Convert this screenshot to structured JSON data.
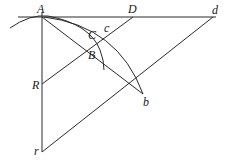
{
  "diagram": {
    "title": "",
    "points": {
      "A": {
        "label": "A",
        "x": 42,
        "y": 17
      },
      "D": {
        "label": "D",
        "x": 133,
        "y": 17
      },
      "d": {
        "label": "d",
        "x": 213,
        "y": 17
      },
      "c": {
        "label": "c",
        "x": 108,
        "y": 30
      },
      "C": {
        "label": "C",
        "x": 95,
        "y": 37
      },
      "B": {
        "label": "B",
        "x": 95,
        "y": 46
      },
      "R": {
        "label": "R",
        "x": 42,
        "y": 84
      },
      "b": {
        "label": "b",
        "x": 143,
        "y": 94
      },
      "r": {
        "label": "r",
        "x": 42,
        "y": 152
      }
    },
    "segments": [
      {
        "name": "horizontal-line-Ad",
        "from": "A",
        "to": "d"
      },
      {
        "name": "vertical-line-Ar",
        "from": "A",
        "to": "r"
      },
      {
        "name": "line-RD",
        "from": "R",
        "to": "D"
      },
      {
        "name": "line-rd",
        "from": "r",
        "to": "d"
      },
      {
        "name": "line-Ab",
        "from": "A",
        "to": "b"
      }
    ],
    "arcs": [
      {
        "name": "small-arc-through-A-B"
      },
      {
        "name": "large-arc-A-to-b"
      }
    ]
  }
}
